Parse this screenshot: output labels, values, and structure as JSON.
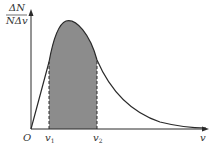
{
  "diagram": {
    "y_axis_label": {
      "numerator": "ΔN",
      "denominator": "NΔv"
    },
    "x_axis_label": "v",
    "origin_label": "O",
    "markers": [
      {
        "label": "v",
        "subscript": "1"
      },
      {
        "label": "v",
        "subscript": "2"
      }
    ],
    "shaded_region": "between v1 and v2 under curve",
    "colors": {
      "curve": "#2a2a2a",
      "shade": "#8c8c8c",
      "axis": "#2a2a2a"
    }
  }
}
